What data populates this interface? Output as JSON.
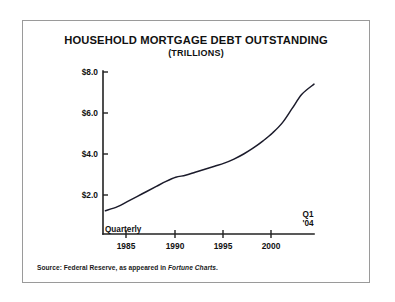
{
  "figure": {
    "title": "HOUSEHOLD MORTGAGE DEBT OUTSTANDING",
    "subtitle": "(TRILLIONS)",
    "source_prefix": "Source: Federal Reserve, as appeared in ",
    "source_publication": "Fortune Charts",
    "source_suffix": ".",
    "frequency_label": "Quarterly",
    "end_label_line1": "Q1",
    "end_label_line2": "'04",
    "line_color": "#1b1b2b",
    "axis_color": "#222222",
    "border_color": "#9a9a9a",
    "background_color": "#ffffff"
  },
  "chart_data": {
    "type": "line",
    "title": "HOUSEHOLD MORTGAGE DEBT OUTSTANDING",
    "subtitle": "(TRILLIONS)",
    "xlabel": "",
    "ylabel": "",
    "ylim": [
      0,
      8.0
    ],
    "xlim": [
      1982.5,
      2004.25
    ],
    "grid": false,
    "legend": false,
    "y_ticks": [
      2.0,
      4.0,
      6.0,
      8.0
    ],
    "y_tick_labels": [
      "$2.0",
      "$4.0",
      "$6.0",
      "$8.0"
    ],
    "x_ticks": [
      1985,
      1990,
      1995,
      2000
    ],
    "x_tick_labels": [
      "1985",
      "1990",
      "1995",
      "2000"
    ],
    "annotations": [
      {
        "text": "Quarterly",
        "x": 1982.8,
        "y": 0.25
      },
      {
        "text": "Q1 '04",
        "x": 2004.0,
        "y": 0.75
      }
    ],
    "series": [
      {
        "name": "Household mortgage debt outstanding",
        "x": [
          1982.75,
          1984.0,
          1985.0,
          1986.0,
          1987.0,
          1988.0,
          1989.0,
          1990.0,
          1991.0,
          1992.0,
          1993.0,
          1994.0,
          1995.0,
          1996.0,
          1997.0,
          1998.0,
          1999.0,
          2000.0,
          2001.0,
          2002.0,
          2003.0,
          2004.25
        ],
        "values": [
          1.15,
          1.35,
          1.6,
          1.85,
          2.1,
          2.35,
          2.6,
          2.8,
          2.9,
          3.05,
          3.2,
          3.35,
          3.5,
          3.7,
          3.95,
          4.25,
          4.6,
          5.0,
          5.5,
          6.2,
          6.9,
          7.4
        ]
      }
    ]
  }
}
